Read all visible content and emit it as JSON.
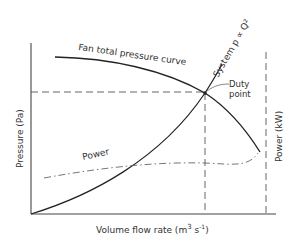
{
  "diagram": {
    "type": "fan-system-characteristic",
    "axes": {
      "x_label": "Volume flow rate (m",
      "x_label_sup": "3",
      "x_label_end": " s",
      "x_label_sup2": "-1",
      "x_label_close": ")",
      "y_left_label": "Pressure (Pa)",
      "y_right_label": "Power (kW)"
    },
    "curves": {
      "fan_label": "Fan total pressure curve",
      "system_label": "System p ∝ Q²",
      "power_label": "Power"
    },
    "annotations": {
      "duty_point_line1": "Duty",
      "duty_point_line2": "point"
    },
    "colors": {
      "line": "#222222",
      "text": "#333333",
      "background": "#ffffff"
    }
  }
}
